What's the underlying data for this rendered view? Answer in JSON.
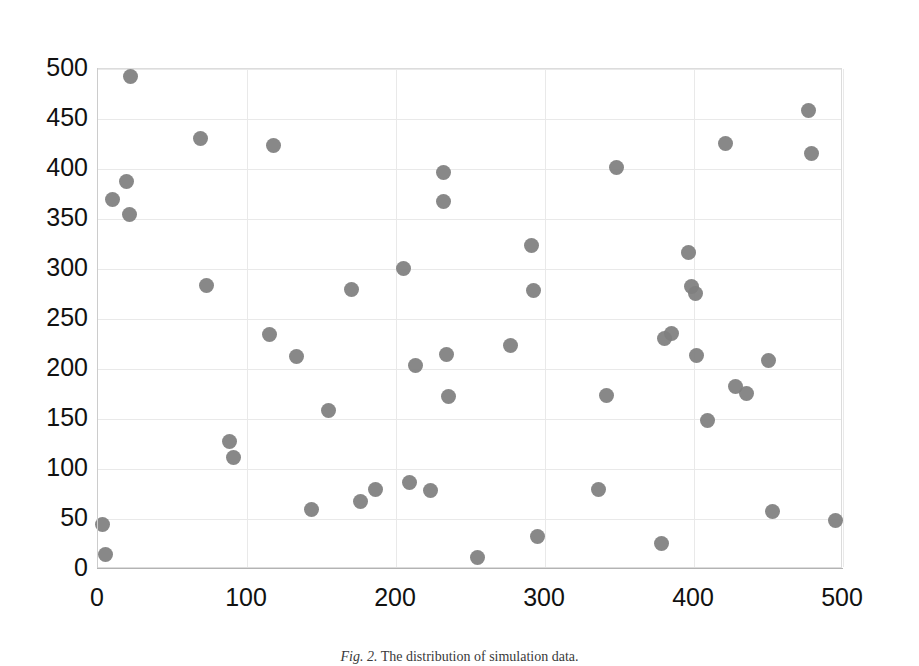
{
  "figure": {
    "caption_label": "Fig. 2.",
    "caption_text": "The distribution of simulation data.",
    "background_color": "#ffffff",
    "marker_color": "#7f7f7f",
    "gridline_color": "#e9e9e9",
    "axis_color": "#b3b3b3"
  },
  "chart_data": {
    "type": "scatter",
    "title": "",
    "xlabel": "",
    "ylabel": "",
    "xlim": [
      0,
      500
    ],
    "ylim": [
      0,
      500
    ],
    "xticks": [
      0,
      100,
      200,
      300,
      400,
      500
    ],
    "yticks": [
      0,
      50,
      100,
      150,
      200,
      250,
      300,
      350,
      400,
      450,
      500
    ],
    "grid": true,
    "legend": null,
    "series": [
      {
        "name": "simulation data",
        "marker": "circle",
        "color": "#7f7f7f",
        "points": [
          [
            3,
            45
          ],
          [
            5,
            15
          ],
          [
            10,
            370
          ],
          [
            19,
            388
          ],
          [
            21,
            355
          ],
          [
            22,
            493
          ],
          [
            69,
            431
          ],
          [
            73,
            284
          ],
          [
            88,
            128
          ],
          [
            91,
            112
          ],
          [
            115,
            235
          ],
          [
            118,
            424
          ],
          [
            133,
            213
          ],
          [
            143,
            60
          ],
          [
            155,
            159
          ],
          [
            170,
            280
          ],
          [
            176,
            68
          ],
          [
            186,
            80
          ],
          [
            205,
            301
          ],
          [
            209,
            87
          ],
          [
            213,
            204
          ],
          [
            223,
            79
          ],
          [
            232,
            397
          ],
          [
            232,
            368
          ],
          [
            234,
            215
          ],
          [
            235,
            173
          ],
          [
            255,
            12
          ],
          [
            277,
            224
          ],
          [
            291,
            324
          ],
          [
            292,
            279
          ],
          [
            295,
            33
          ],
          [
            336,
            80
          ],
          [
            341,
            174
          ],
          [
            348,
            402
          ],
          [
            378,
            26
          ],
          [
            380,
            231
          ],
          [
            385,
            236
          ],
          [
            396,
            317
          ],
          [
            398,
            283
          ],
          [
            401,
            276
          ],
          [
            402,
            214
          ],
          [
            409,
            149
          ],
          [
            421,
            426
          ],
          [
            428,
            183
          ],
          [
            435,
            176
          ],
          [
            450,
            209
          ],
          [
            453,
            58
          ],
          [
            477,
            459
          ],
          [
            479,
            416
          ],
          [
            495,
            49
          ]
        ]
      }
    ]
  }
}
